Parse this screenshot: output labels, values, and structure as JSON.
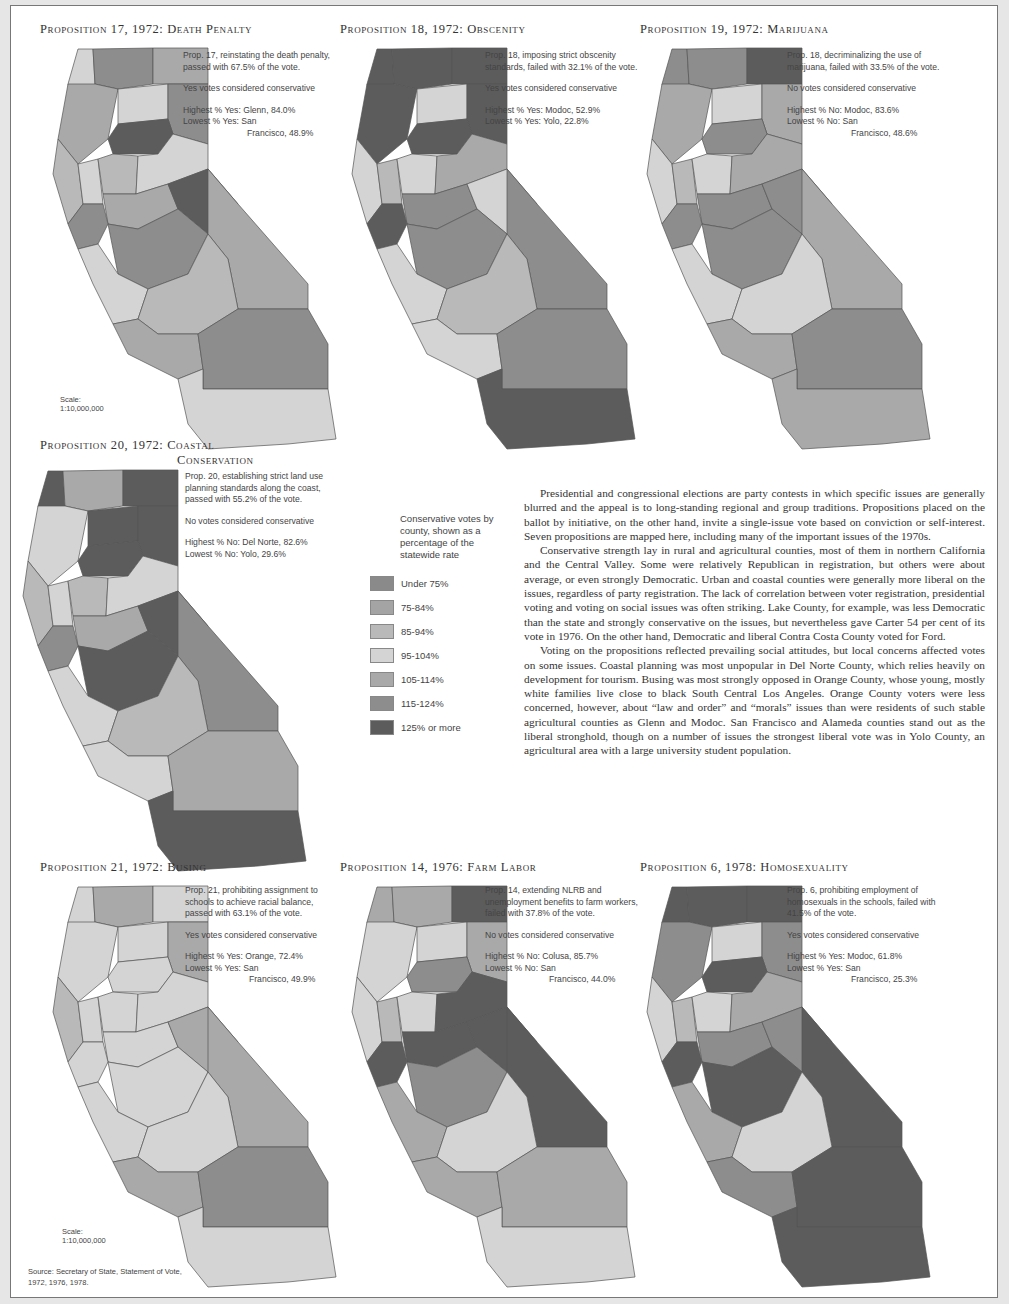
{
  "legend": {
    "heading": "Conservative votes by county, shown as a percentage of the statewide rate",
    "classes": [
      {
        "label": "Under 75%",
        "color": "#8a8a8a"
      },
      {
        "label": "75-84%",
        "color": "#a4a4a4"
      },
      {
        "label": "85-94%",
        "color": "#b9b9b9"
      },
      {
        "label": "95-104%",
        "color": "#d4d4d4"
      },
      {
        "label": "105-114%",
        "color": "#a9a9a9"
      },
      {
        "label": "115-124%",
        "color": "#8d8d8d"
      },
      {
        "label": "125% or more",
        "color": "#5c5c5c"
      }
    ]
  },
  "panels": [
    {
      "title": "Proposition 17, 1972: Death Penalty",
      "desc": "Prop. 17, reinstating the death penalty, passed with 67.5% of the vote.",
      "rule": "Yes votes considered conservative",
      "highest": "Highest % Yes: Glenn, 84.0%",
      "lowest_a": "Lowest % Yes: San",
      "lowest_b": "Francisco, 48.9%",
      "scale": "Scale: 1:10,000,000",
      "shades": [
        3,
        5,
        4,
        4,
        3,
        5,
        6,
        2,
        3,
        2,
        3,
        4,
        5,
        6,
        5,
        4,
        3,
        2,
        4,
        5,
        3
      ]
    },
    {
      "title": "Proposition 18, 1972: Obscenity",
      "desc": "Prop. 18, imposing strict obscenity standards, failed with 32.1% of the vote.",
      "rule": "Yes votes considered conservative",
      "highest": "Highest % Yes: Modoc, 52.9%",
      "lowest_a": "Lowest % Yes: Yolo, 22.8%",
      "lowest_b": "",
      "scale": "",
      "shades": [
        6,
        6,
        6,
        6,
        3,
        6,
        6,
        3,
        2,
        3,
        4,
        5,
        6,
        3,
        5,
        5,
        3,
        2,
        3,
        5,
        6
      ]
    },
    {
      "title": "Proposition 19, 1972: Marijuana",
      "desc": "Prop. 18, decriminalizing the use of marijuana, failed with 33.5% of the vote.",
      "rule": "No votes considered conservative",
      "highest": "Highest % No: Modoc, 83.6%",
      "lowest_a": "Lowest % No: San",
      "lowest_b": "Francisco, 48.6%",
      "scale": "",
      "shades": [
        5,
        5,
        6,
        4,
        3,
        4,
        5,
        3,
        2,
        3,
        4,
        5,
        5,
        5,
        5,
        4,
        3,
        3,
        4,
        5,
        4
      ]
    },
    {
      "title": "Proposition 20, 1972: Coastal",
      "title2": "Conservation",
      "desc": "Prop. 20, establishing strict land use planning standards along the coast, passed with 55.2% of the vote.",
      "rule": "No votes considered conservative",
      "highest": "Highest % No: Del Norte, 82.6%",
      "lowest_a": "Lowest % No: Yolo, 29.6%",
      "lowest_b": "",
      "scale": "",
      "shades": [
        6,
        4,
        6,
        3,
        6,
        6,
        6,
        2,
        3,
        2,
        3,
        4,
        5,
        6,
        6,
        5,
        3,
        2,
        3,
        4,
        6
      ]
    },
    {
      "title": "Proposition 21, 1972: Busing",
      "desc": "Prop. 21, prohibiting assignment to schools to achieve racial balance, passed with 63.1% of the vote.",
      "rule": "Yes votes considered conservative",
      "highest": "Highest % Yes: Orange, 72.4%",
      "lowest_a": "Lowest % Yes: San",
      "lowest_b": "Francisco, 49.9%",
      "scale": "Scale: 1:10,000,000",
      "shades": [
        3,
        4,
        3,
        3,
        3,
        4,
        3,
        2,
        3,
        3,
        3,
        3,
        3,
        4,
        3,
        4,
        3,
        3,
        4,
        5,
        3
      ]
    },
    {
      "title": "Proposition 14, 1976: Farm Labor",
      "desc": "Prop. 14, extending NLRB and unemployment benefits to farm workers, failed with 37.8% of the vote.",
      "rule": "No votes considered conservative",
      "highest": "Highest % No: Colusa, 85.7%",
      "lowest_a": "Lowest % No: San",
      "lowest_b": "Francisco, 44.0%",
      "scale": "",
      "shades": [
        4,
        4,
        6,
        3,
        3,
        4,
        5,
        3,
        2,
        3,
        6,
        6,
        6,
        6,
        5,
        6,
        4,
        3,
        4,
        4,
        3
      ]
    },
    {
      "title": "Proposition 6, 1978: Homosexuality",
      "desc": "Prop. 6, prohibiting employment of homosexuals in the schools, failed with 41.5% of the vote.",
      "rule": "Yes votes considered conservative",
      "highest": "Highest % Yes: Modoc, 61.8%",
      "lowest_a": "Lowest % Yes: San",
      "lowest_b": "Francisco, 25.3%",
      "scale": "",
      "shades": [
        6,
        6,
        6,
        5,
        3,
        5,
        6,
        3,
        2,
        3,
        4,
        5,
        6,
        5,
        6,
        6,
        4,
        3,
        5,
        6,
        6
      ]
    }
  ],
  "essay": [
    "Presidential and congressional elections are party contests in which specific issues are generally blurred and the appeal is to long-standing regional and group traditions. Propositions placed on the ballot by initiative, on the other hand, invite a single-issue vote based on conviction or self-interest. Seven propositions are mapped here, including many of the important issues of the 1970s.",
    "Conservative strength lay in rural and agricultural counties, most of them in northern California and the Central Valley. Some were relatively Republican in registration, but others were about average, or even strongly Democratic. Urban and coastal counties were generally more liberal on the issues, regardless of party registration. The lack of correlation between voter registration, presidential voting and voting on social issues was often striking. Lake County, for example, was less Democratic than the state and strongly conservative on the issues, but nevertheless gave Carter 54 per cent of its vote in 1976. On the other hand, Democratic and liberal Contra Costa County voted for Ford.",
    "Voting on the propositions reflected prevailing social attitudes, but local concerns affected votes on some issues. Coastal planning was most unpopular in Del Norte County, which relies heavily on development for tourism. Busing was most strongly opposed in Orange County, whose young, mostly white families live close to black South Central Los Angeles. Orange County voters were less concerned, however, about “law and order” and “morals” issues than were residents of such stable agricultural counties as Glenn and Modoc. San Francisco and Alameda counties stand out as the liberal stronghold, though on a number of issues the strongest liberal vote was in Yolo County, an agricultural area with a large university student population."
  ],
  "source": {
    "line1": "Source: Secretary of State, Statement of Vote,",
    "line2": "1972, 1976, 1978."
  }
}
